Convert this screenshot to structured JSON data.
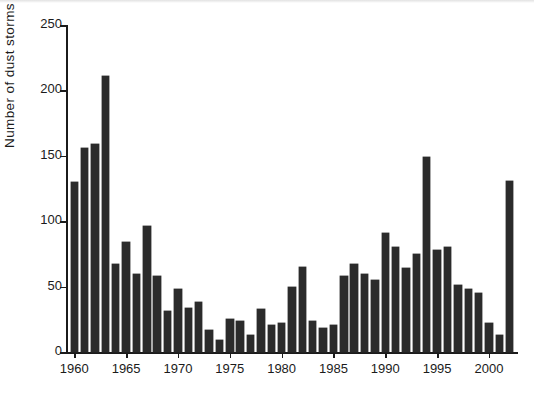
{
  "chart_data": {
    "type": "bar",
    "title": "",
    "xlabel": "",
    "ylabel": "Number of dust storms",
    "ylim": [
      0,
      250
    ],
    "ytick_values": [
      0,
      50,
      100,
      150,
      200,
      250
    ],
    "ytick_labels": [
      "0",
      "50",
      "100",
      "150",
      "200",
      "250"
    ],
    "xlim": [
      1959.2,
      2002.8
    ],
    "xtick_values": [
      1960,
      1965,
      1970,
      1975,
      1980,
      1985,
      1990,
      1995,
      2000
    ],
    "xtick_labels": [
      "1960",
      "1965",
      "1970",
      "1975",
      "1980",
      "1985",
      "1990",
      "1995",
      "2000"
    ],
    "grid": false,
    "legend": null,
    "bar_color": "#2b2b2b",
    "categories": [
      1960,
      1961,
      1962,
      1963,
      1964,
      1965,
      1966,
      1967,
      1968,
      1969,
      1970,
      1971,
      1972,
      1973,
      1974,
      1975,
      1976,
      1977,
      1978,
      1979,
      1980,
      1981,
      1982,
      1983,
      1984,
      1985,
      1986,
      1987,
      1988,
      1989,
      1990,
      1991,
      1992,
      1993,
      1994,
      1995,
      1996,
      1997,
      1998,
      1999,
      2000,
      2001,
      2002
    ],
    "values": [
      130,
      156,
      159,
      211,
      67,
      84,
      60,
      96,
      58,
      31,
      48,
      34,
      38,
      17,
      9,
      25,
      24,
      13,
      33,
      21,
      22,
      50,
      65,
      24,
      18,
      21,
      58,
      67,
      60,
      55,
      91,
      80,
      64,
      75,
      149,
      78,
      80,
      51,
      48,
      45,
      22,
      13,
      131
    ]
  }
}
